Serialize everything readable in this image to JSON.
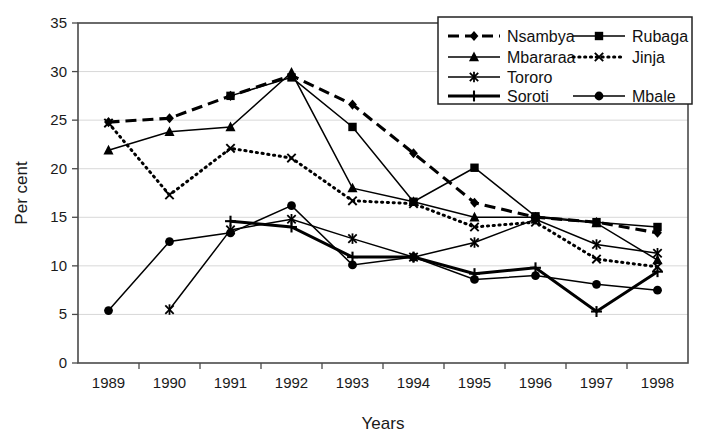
{
  "chart_data": {
    "type": "line",
    "title": "",
    "xlabel": "Years",
    "ylabel": "Per cent",
    "x": [
      1989,
      1990,
      1991,
      1992,
      1993,
      1994,
      1995,
      1996,
      1997,
      1998
    ],
    "categories": [
      "1989",
      "1990",
      "1991",
      "1992",
      "1993",
      "1994",
      "1995",
      "1996",
      "1997",
      "1998"
    ],
    "ylim": [
      0,
      35
    ],
    "yticks": [
      0,
      5,
      10,
      15,
      20,
      25,
      30,
      35
    ],
    "ytick_labels": [
      "0",
      "5",
      "10",
      "15",
      "20",
      "25",
      "30",
      "35"
    ],
    "grid": true,
    "legend_position": "top-right",
    "series": [
      {
        "name": "Nsambya",
        "marker": "diamond",
        "line_style": "dashed",
        "values": [
          24.8,
          25.2,
          27.5,
          29.6,
          26.6,
          21.6,
          16.5,
          15.0,
          14.5,
          13.4
        ]
      },
      {
        "name": "Rubaga",
        "marker": "square",
        "line_style": "solid",
        "values": [
          null,
          null,
          27.5,
          29.4,
          24.3,
          16.6,
          20.1,
          15.1,
          14.5,
          14.0
        ]
      },
      {
        "name": "Mbararaa",
        "marker": "triangle",
        "line_style": "solid",
        "values": [
          21.9,
          23.8,
          24.3,
          29.9,
          18.0,
          16.6,
          15.0,
          15.0,
          14.4,
          10.6
        ]
      },
      {
        "name": "Jinja",
        "marker": "x",
        "line_style": "dotted",
        "values": [
          24.7,
          17.3,
          22.1,
          21.1,
          16.7,
          16.4,
          14.0,
          14.5,
          10.7,
          9.9
        ]
      },
      {
        "name": "Tororo",
        "marker": "asterisk",
        "line_style": "solid",
        "values": [
          null,
          5.5,
          13.7,
          14.8,
          12.8,
          10.9,
          12.4,
          14.8,
          12.2,
          11.3
        ]
      },
      {
        "name": "Soroti",
        "marker": "plus",
        "line_style": "solid-bold",
        "values": [
          null,
          null,
          14.6,
          14.0,
          10.9,
          10.9,
          9.2,
          9.8,
          5.3,
          9.4
        ]
      },
      {
        "name": "Mbale",
        "marker": "circle",
        "line_style": "solid",
        "values": [
          5.4,
          12.5,
          13.4,
          16.2,
          10.1,
          10.9,
          8.6,
          9.0,
          8.1,
          7.5
        ]
      }
    ]
  },
  "legend": {
    "entries": [
      {
        "label": "Nsambya"
      },
      {
        "label": "Rubaga"
      },
      {
        "label": "Mbararaa"
      },
      {
        "label": "Jinja"
      },
      {
        "label": "Tororo"
      },
      {
        "label": "Soroti"
      },
      {
        "label": "Mbale"
      }
    ]
  }
}
